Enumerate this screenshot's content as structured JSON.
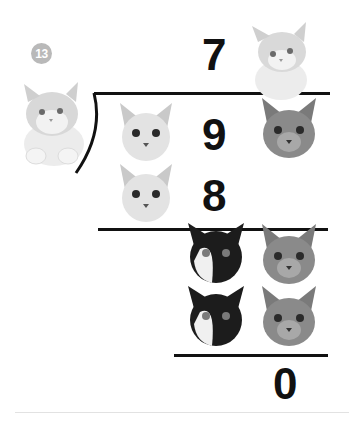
{
  "problem": {
    "number": "13",
    "quotient": "7",
    "dividend": "9",
    "product": "8",
    "remainder": "0"
  },
  "pictures": {
    "divisor": "fluffy-kitten",
    "quotient": "fluffy-kitten",
    "dividend_left": "siamese-cat-face",
    "dividend_right": "tabby-cat-face",
    "product_left": "siamese-cat-face",
    "subtraction_row1": [
      "tuxedo-cat-face",
      "tabby-cat-face"
    ],
    "subtraction_row2": [
      "tuxedo-cat-face",
      "tabby-cat-face"
    ]
  },
  "colors": {
    "ink": "#111111",
    "badge": "#b9b9b9",
    "separator": "#e2e2e2"
  }
}
